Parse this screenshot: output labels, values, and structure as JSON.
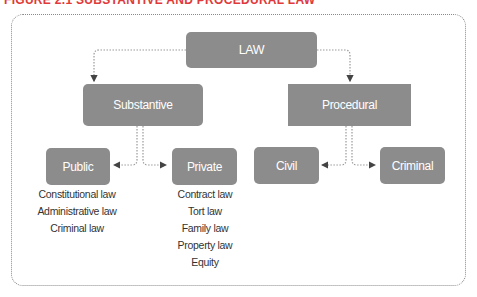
{
  "figure": {
    "title": "FIGURE 2.1 SUBSTANTIVE AND PROCEDURAL LAW"
  },
  "diagram": {
    "root": {
      "label": "LAW"
    },
    "level1": [
      {
        "label": "Substantive"
      },
      {
        "label": "Procedural"
      }
    ],
    "substantive_children": [
      {
        "label": "Public",
        "items": [
          "Constitutional law",
          "Administrative law",
          "Criminal law"
        ]
      },
      {
        "label": "Private",
        "items": [
          "Contract law",
          "Tort law",
          "Family law",
          "Property law",
          "Equity"
        ]
      }
    ],
    "procedural_children": [
      {
        "label": "Civil"
      },
      {
        "label": "Criminal"
      }
    ],
    "colors": {
      "node_fill": "#8c8c8c",
      "node_text": "#ffffff",
      "connector": "#9a9a9a",
      "title": "#e03a3a"
    }
  }
}
